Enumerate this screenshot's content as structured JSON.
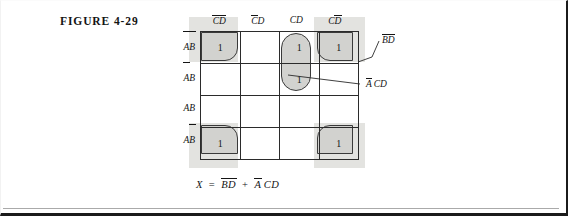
{
  "figure": {
    "title": "FIGURE 4-29",
    "caption_number": "4-29"
  },
  "kmap": {
    "type": "karnaugh-map",
    "variables": [
      "A",
      "B",
      "C",
      "D"
    ],
    "column_headers": [
      {
        "plain": "CD",
        "parts": [
          {
            "t": "C",
            "bar": true
          },
          {
            "t": "D",
            "bar": true
          }
        ]
      },
      {
        "plain": "CD",
        "parts": [
          {
            "t": "C",
            "bar": true
          },
          {
            "t": "D",
            "bar": false
          }
        ]
      },
      {
        "plain": "CD",
        "parts": [
          {
            "t": "C",
            "bar": false
          },
          {
            "t": "D",
            "bar": false
          }
        ]
      },
      {
        "plain": "CD",
        "parts": [
          {
            "t": "C",
            "bar": false
          },
          {
            "t": "D",
            "bar": true
          }
        ]
      }
    ],
    "row_headers": [
      {
        "plain": "AB",
        "parts": [
          {
            "t": "A",
            "bar": true
          },
          {
            "t": "B",
            "bar": true
          }
        ]
      },
      {
        "plain": "AB",
        "parts": [
          {
            "t": "A",
            "bar": true
          },
          {
            "t": "B",
            "bar": false
          }
        ]
      },
      {
        "plain": "AB",
        "parts": [
          {
            "t": "A",
            "bar": false
          },
          {
            "t": "B",
            "bar": false
          }
        ]
      },
      {
        "plain": "AB",
        "parts": [
          {
            "t": "A",
            "bar": false
          },
          {
            "t": "B",
            "bar": true
          }
        ]
      }
    ],
    "cells": [
      [
        "1",
        "",
        "1",
        "1"
      ],
      [
        "",
        "",
        "1",
        ""
      ],
      [
        "",
        "",
        "",
        ""
      ],
      [
        "1",
        "",
        "",
        "1"
      ]
    ],
    "groups": [
      {
        "name": "BD-corners",
        "label_plain": "BD",
        "label_parts": [
          {
            "t": "B",
            "bar": true
          },
          {
            "t": "D",
            "bar": true
          }
        ],
        "cells": [
          "r0c0",
          "r0c3",
          "r3c0",
          "r3c3"
        ],
        "shape": "four-corner"
      },
      {
        "name": "ACD-vertical",
        "label_plain": "ACD",
        "label_parts": [
          {
            "t": "A",
            "bar": true
          },
          {
            "t": "C",
            "bar": false
          },
          {
            "t": "D",
            "bar": false
          }
        ],
        "cells": [
          "r0c2",
          "r1c2"
        ],
        "shape": "vertical-stadium"
      }
    ]
  },
  "equation": {
    "lhs": "X",
    "eq": "=",
    "term1_parts": [
      {
        "t": "B",
        "bar": true
      },
      {
        "t": "D",
        "bar": true
      }
    ],
    "operator": "+",
    "term2_parts": [
      {
        "t": "A",
        "bar": true
      },
      {
        "t": "C",
        "bar": false
      },
      {
        "t": "D",
        "bar": false
      }
    ],
    "plain": "X = BD + ACD"
  },
  "colors": {
    "group_fill": "#d2d2cf",
    "halo": "#dededa",
    "grid_line": "#2b2b2b",
    "ink": "#141414",
    "frame": "#1b1b1b"
  }
}
